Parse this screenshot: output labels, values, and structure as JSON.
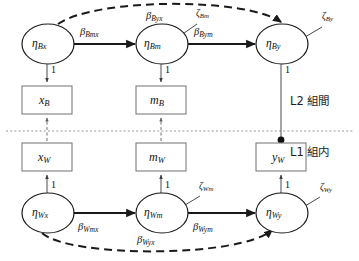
{
  "figure": {
    "type": "path-diagram",
    "width": 359,
    "height": 261,
    "background_color": "#ffffff"
  },
  "levels": [
    {
      "id": "L2",
      "label": "L2 組間"
    },
    {
      "id": "L1",
      "label": "L1 組内"
    }
  ],
  "latent_nodes": [
    {
      "id": "eta_Bx",
      "base": "η",
      "sub": "Bx",
      "level": "L2",
      "cx": 48,
      "cy": 44
    },
    {
      "id": "eta_Bm",
      "base": "η",
      "sub": "Bm",
      "level": "L2",
      "cx": 162,
      "cy": 44
    },
    {
      "id": "eta_By",
      "base": "η",
      "sub": "By",
      "level": "L2",
      "cx": 282,
      "cy": 44
    },
    {
      "id": "eta_Wx",
      "base": "η",
      "sub": "Wx",
      "level": "L1",
      "cx": 48,
      "cy": 213
    },
    {
      "id": "eta_Wm",
      "base": "η",
      "sub": "Wm",
      "level": "L1",
      "cx": 162,
      "cy": 213
    },
    {
      "id": "eta_Wy",
      "base": "η",
      "sub": "Wy",
      "level": "L1",
      "cx": 282,
      "cy": 213
    }
  ],
  "observed_boxes": [
    {
      "id": "x_B",
      "base": "x",
      "sub": "B",
      "level": "L2",
      "x": 22,
      "y": 86,
      "w": 50,
      "h": 28
    },
    {
      "id": "m_B",
      "base": "m",
      "sub": "B",
      "level": "L2",
      "x": 136,
      "y": 86,
      "w": 50,
      "h": 28
    },
    {
      "id": "x_W",
      "base": "x",
      "sub": "W",
      "level": "L1",
      "x": 22,
      "y": 143,
      "w": 50,
      "h": 28
    },
    {
      "id": "m_W",
      "base": "m",
      "sub": "W",
      "level": "L1",
      "x": 136,
      "y": 143,
      "w": 50,
      "h": 28
    },
    {
      "id": "y_W",
      "base": "y",
      "sub": "W",
      "level": "L1",
      "x": 256,
      "y": 143,
      "w": 50,
      "h": 28
    }
  ],
  "structural_paths": [
    {
      "id": "beta_Bmx",
      "base": "β",
      "sub": "Bmx",
      "from": "eta_Bx",
      "to": "eta_Bm",
      "style": "solid",
      "label_x": 86,
      "label_y": 33
    },
    {
      "id": "beta_Bym",
      "base": "β",
      "sub": "Bym",
      "from": "eta_Bm",
      "to": "eta_By",
      "style": "solid",
      "label_x": 199,
      "label_y": 33
    },
    {
      "id": "beta_Byx",
      "base": "β",
      "sub": "Byx",
      "from": "eta_Bx",
      "to": "eta_By",
      "style": "dashed",
      "label_x": 150,
      "label_y": 14
    },
    {
      "id": "beta_Wmx",
      "base": "β",
      "sub": "Wmx",
      "from": "eta_Wx",
      "to": "eta_Wm",
      "style": "solid",
      "label_x": 84,
      "label_y": 227
    },
    {
      "id": "beta_Wym",
      "base": "β",
      "sub": "Wym",
      "from": "eta_Wm",
      "to": "eta_Wy",
      "style": "solid",
      "label_x": 199,
      "label_y": 227
    },
    {
      "id": "beta_Wyx",
      "base": "β",
      "sub": "Wyx",
      "from": "eta_Wx",
      "to": "eta_Wy",
      "style": "dashed",
      "label_x": 143,
      "label_y": 238
    }
  ],
  "disturbances": [
    {
      "id": "zeta_Bm",
      "base": "ζ",
      "sub": "Bm",
      "target": "eta_Bm",
      "label_x": 192,
      "label_y": 14
    },
    {
      "id": "zeta_By",
      "base": "ζ",
      "sub": "By",
      "target": "eta_By",
      "label_x": 320,
      "label_y": 17
    },
    {
      "id": "zeta_Wm",
      "base": "ζ",
      "sub": "Wm",
      "target": "eta_Wm",
      "label_x": 196,
      "label_y": 186
    },
    {
      "id": "zeta_Wy",
      "base": "ζ",
      "sub": "Wy",
      "target": "eta_Wy",
      "label_x": 318,
      "label_y": 188
    }
  ],
  "loadings": [
    {
      "id": "load_Bx",
      "value": "1",
      "from": "eta_Bx",
      "to": "x_B",
      "label_x": 52,
      "label_y": 68
    },
    {
      "id": "load_Bm",
      "value": "1",
      "from": "eta_Bm",
      "to": "m_B",
      "label_x": 166,
      "label_y": 68
    },
    {
      "id": "load_By",
      "value": "1",
      "from": "eta_By",
      "to": "y_W",
      "label_x": 286,
      "label_y": 68
    },
    {
      "id": "load_Wx",
      "value": "1",
      "from": "eta_Wx",
      "to": "x_W",
      "label_x": 52,
      "label_y": 183
    },
    {
      "id": "load_Wm",
      "value": "1",
      "from": "eta_Wm",
      "to": "m_W",
      "label_x": 166,
      "label_y": 183
    },
    {
      "id": "load_Wy",
      "value": "1",
      "from": "eta_Wy",
      "to": "y_W",
      "label_x": 286,
      "label_y": 183
    }
  ],
  "colors": {
    "stroke": "#1a1a1a",
    "box_stroke": "#7d7d7d",
    "divider": "#8a8a8a",
    "background": "#ffffff"
  }
}
